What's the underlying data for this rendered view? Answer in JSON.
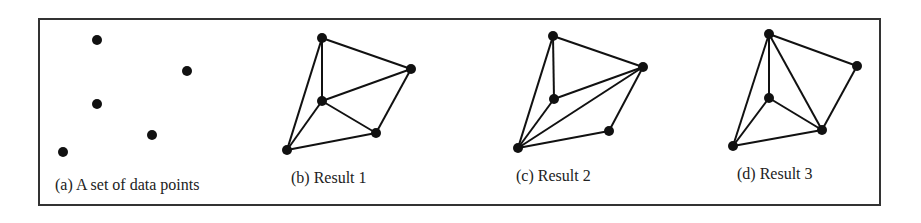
{
  "figure": {
    "frame": {
      "x": 39,
      "y": 19,
      "width": 841,
      "height": 186,
      "stroke": "#333333"
    },
    "panels": [
      {
        "id": "a",
        "label": "(a) A set of data points",
        "label_pos": [
          55,
          190
        ],
        "points": [
          [
            97,
            40
          ],
          [
            187,
            71
          ],
          [
            97,
            104
          ],
          [
            152,
            135
          ],
          [
            63,
            152
          ]
        ],
        "edges": []
      },
      {
        "id": "b",
        "label": "(b) Result 1",
        "label_pos": [
          291,
          183
        ],
        "points": [
          [
            322,
            38
          ],
          [
            411,
            69
          ],
          [
            322,
            101
          ],
          [
            376,
            133
          ],
          [
            287,
            150
          ]
        ],
        "edges": [
          [
            0,
            1
          ],
          [
            0,
            2
          ],
          [
            0,
            4
          ],
          [
            1,
            2
          ],
          [
            1,
            3
          ],
          [
            2,
            3
          ],
          [
            2,
            4
          ],
          [
            3,
            4
          ]
        ]
      },
      {
        "id": "c",
        "label": "(c) Result 2",
        "label_pos": [
          516,
          181
        ],
        "points": [
          [
            553,
            36
          ],
          [
            643,
            67
          ],
          [
            554,
            99
          ],
          [
            609,
            131
          ],
          [
            518,
            148
          ]
        ],
        "edges": [
          [
            0,
            1
          ],
          [
            0,
            2
          ],
          [
            0,
            4
          ],
          [
            1,
            2
          ],
          [
            1,
            4
          ],
          [
            1,
            3
          ],
          [
            2,
            4
          ],
          [
            3,
            4
          ]
        ]
      },
      {
        "id": "d",
        "label": "(d) Result 3",
        "label_pos": [
          737,
          179
        ],
        "points": [
          [
            769,
            34
          ],
          [
            857,
            66
          ],
          [
            769,
            98
          ],
          [
            822,
            130
          ],
          [
            733,
            146
          ]
        ],
        "edges": [
          [
            0,
            1
          ],
          [
            0,
            2
          ],
          [
            0,
            3
          ],
          [
            0,
            4
          ],
          [
            1,
            3
          ],
          [
            2,
            3
          ],
          [
            2,
            4
          ],
          [
            3,
            4
          ]
        ]
      }
    ],
    "point_radius": 5,
    "point_color": "#111111",
    "edge_color": "#111111"
  }
}
